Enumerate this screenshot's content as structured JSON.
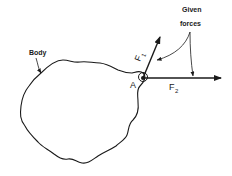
{
  "diagram": {
    "body_label": "Body",
    "point_label": "A",
    "callout_label_line1": "Given",
    "callout_label_line2": "forces",
    "forces": [
      {
        "name": "F",
        "subscript": "1"
      },
      {
        "name": "F",
        "subscript": "2"
      }
    ],
    "colors": {
      "stroke": "#1a1a1a",
      "background": "#ffffff"
    }
  }
}
